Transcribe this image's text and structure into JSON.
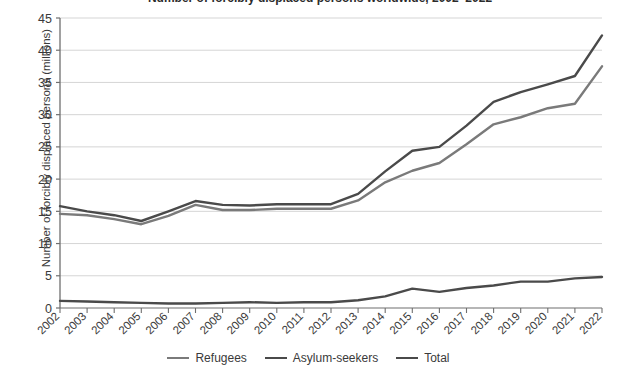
{
  "chart_data": {
    "type": "line",
    "title": "Number of forcibly displaced persons worldwide, 2002–2022",
    "xlabel": "",
    "ylabel": "Number of forcibly displaced persons (millions)",
    "x": [
      "2002",
      "2003",
      "2004",
      "2005",
      "2006",
      "2007",
      "2008",
      "2009",
      "2010",
      "2011",
      "2012",
      "2013",
      "2014",
      "2015",
      "2016",
      "2017",
      "2018",
      "2019",
      "2020",
      "2021",
      "2022"
    ],
    "xlim": [
      "2002",
      "2022"
    ],
    "ylim": [
      0,
      45
    ],
    "ytick_labels": [
      "0",
      "5",
      "10",
      "15",
      "20",
      "25",
      "30",
      "35",
      "40",
      "45"
    ],
    "ytick_values": [
      0,
      5,
      10,
      15,
      20,
      25,
      30,
      35,
      40,
      45
    ],
    "grid": true,
    "legend_position": "bottom",
    "series": [
      {
        "name": "Refugees",
        "color": "#7a7a7a",
        "values": [
          14.6,
          14.4,
          13.8,
          13.0,
          14.3,
          16.0,
          15.2,
          15.2,
          15.4,
          15.4,
          15.4,
          16.7,
          19.5,
          21.3,
          22.5,
          25.4,
          28.5,
          29.6,
          31.0,
          31.7,
          37.5
        ]
      },
      {
        "name": "Asylum-seekers",
        "color": "#4a4a4a",
        "values": [
          1.1,
          1.0,
          0.9,
          0.8,
          0.7,
          0.7,
          0.8,
          0.9,
          0.8,
          0.9,
          0.9,
          1.2,
          1.8,
          3.0,
          2.5,
          3.1,
          3.5,
          4.1,
          4.1,
          4.6,
          4.8
        ]
      },
      {
        "name": "Total",
        "color": "#4a4a4a",
        "values": [
          15.8,
          15.0,
          14.4,
          13.5,
          15.0,
          16.6,
          16.0,
          15.9,
          16.1,
          16.1,
          16.1,
          17.7,
          21.2,
          24.4,
          25.0,
          28.3,
          32.0,
          33.5,
          34.7,
          36.0,
          42.3
        ]
      }
    ]
  },
  "legend": {
    "items": [
      {
        "label": "Refugees"
      },
      {
        "label": "Asylum-seekers"
      },
      {
        "label": "Total"
      }
    ]
  },
  "axes": {
    "y_axis_title": "Number of forcibly displaced persons (millions)"
  }
}
